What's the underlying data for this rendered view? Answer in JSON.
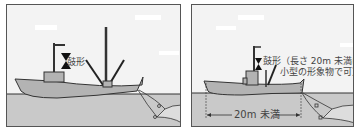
{
  "panels": [
    {
      "id": "large-vessel",
      "shape_label": "鼓形",
      "shape_icon": "hourglass-shape-icon"
    },
    {
      "id": "small-vessel",
      "shape_label_line1": "鼓形（長さ 20m 未満は",
      "shape_label_line2": "小型の形象物で可）",
      "length_label": "20m 未満",
      "shape_icon": "hourglass-shape-icon"
    }
  ],
  "colors": {
    "sky": "#f3f3f3",
    "sea": "#c9c9c9",
    "hull": "#b3b3b3",
    "line": "#333333",
    "shape": "#111111"
  }
}
